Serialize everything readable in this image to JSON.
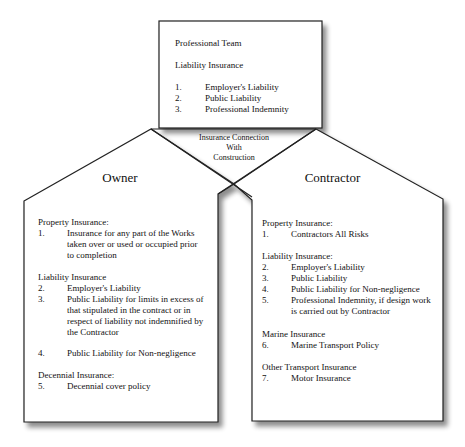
{
  "diagram": {
    "center_label": [
      "Insurance Connection",
      "With",
      "Construction"
    ],
    "professional_team": {
      "title": "Professional Team",
      "section": "Liability Insurance",
      "items": [
        {
          "num": "1.",
          "text": "Employer's Liability"
        },
        {
          "num": "2.",
          "text": "Public Liability"
        },
        {
          "num": "3.",
          "text": "Professional Indemnity"
        }
      ]
    },
    "owner": {
      "title": "Owner",
      "sections": [
        {
          "heading": "Property Insurance:",
          "items": [
            {
              "num": "1.",
              "lines": [
                "Insurance for any part of the Works",
                "taken over or used or occupied prior",
                "to completion"
              ]
            }
          ]
        },
        {
          "heading": "Liability Insurance",
          "items": [
            {
              "num": "2.",
              "lines": [
                "Employer's Liability"
              ]
            },
            {
              "num": "3.",
              "lines": [
                "Public Liability for limits in excess of",
                "that stipulated in the contract or in",
                "respect of liability not indemnified by",
                "the Contractor"
              ]
            },
            {
              "num": "4.",
              "lines": [
                "Public Liability for Non-negligence"
              ]
            }
          ]
        },
        {
          "heading": "Decennial Insurance:",
          "items": [
            {
              "num": "5.",
              "lines": [
                "Decennial cover policy"
              ]
            }
          ]
        }
      ]
    },
    "contractor": {
      "title": "Contractor",
      "sections": [
        {
          "heading": "Property Insurance:",
          "items": [
            {
              "num": "1.",
              "lines": [
                "Contractors All Risks"
              ]
            }
          ]
        },
        {
          "heading": "Liability Insurance:",
          "items": [
            {
              "num": "2.",
              "lines": [
                "Employer's Liability"
              ]
            },
            {
              "num": "3.",
              "lines": [
                "Public Liability"
              ]
            },
            {
              "num": "4.",
              "lines": [
                "Public Liability for Non-negligence"
              ]
            },
            {
              "num": "5.",
              "lines": [
                "Professional Indemnity, if design work",
                "is carried out by Contractor"
              ]
            }
          ]
        },
        {
          "heading": "Marine Insurance",
          "items": [
            {
              "num": "6.",
              "lines": [
                "Marine Transport Policy"
              ]
            }
          ]
        },
        {
          "heading": "Other Transport Insurance",
          "items": [
            {
              "num": "7.",
              "lines": [
                "Motor Insurance"
              ]
            }
          ]
        }
      ]
    }
  }
}
